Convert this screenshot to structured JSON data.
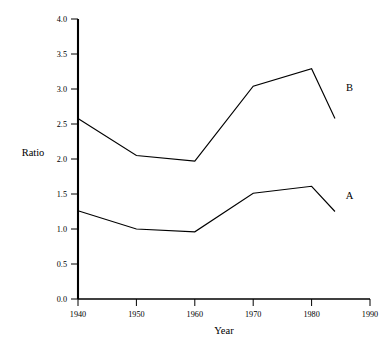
{
  "chart_data": {
    "type": "line",
    "title": "",
    "subtitle": "",
    "xlabel": "Year",
    "ylabel": "Ratio",
    "xlim": [
      1940,
      1990
    ],
    "ylim": [
      0.0,
      4.0
    ],
    "xticks": [
      1940,
      1950,
      1960,
      1970,
      1980,
      1990
    ],
    "xtick_labels": [
      "1940",
      "1950",
      "1960",
      "1970",
      "1980",
      "1990"
    ],
    "yticks": [
      0.0,
      0.5,
      1.0,
      1.5,
      2.0,
      2.5,
      3.0,
      3.5,
      4.0
    ],
    "ytick_labels": [
      "0.0",
      "0.5",
      "1.0",
      "1.5",
      "2.0",
      "2.5",
      "3.0",
      "3.5",
      "4.0"
    ],
    "grid": false,
    "legend_position": "inline-right-of-series",
    "x": [
      1940,
      1950,
      1960,
      1970,
      1980,
      1984
    ],
    "series": [
      {
        "name": "B",
        "label": "B",
        "color": "#000000",
        "values": [
          2.58,
          2.05,
          1.97,
          3.04,
          3.29,
          2.58
        ],
        "label_x": 1986.5,
        "label_y": 3.02
      },
      {
        "name": "A",
        "label": "A",
        "color": "#000000",
        "values": [
          1.26,
          1.0,
          0.96,
          1.51,
          1.61,
          1.25
        ],
        "label_x": 1986.5,
        "label_y": 1.48
      }
    ]
  },
  "axes": {
    "y_axis_name": "y-axis",
    "x_axis_name": "x-axis"
  }
}
